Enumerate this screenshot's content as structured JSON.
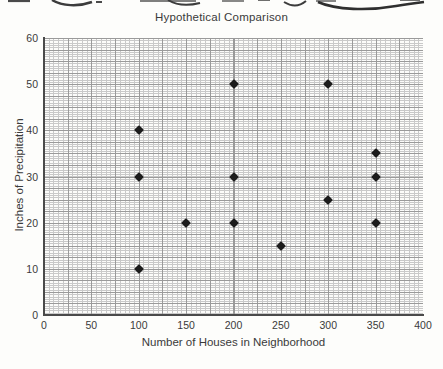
{
  "chart_data": {
    "type": "scatter",
    "title": "Hypothetical Comparison",
    "xlabel": "Number of Houses in Neighborhood",
    "ylabel": "Inches of Precipitation",
    "xlim": [
      0,
      400
    ],
    "ylim": [
      0,
      60
    ],
    "xticks": [
      0,
      50,
      100,
      150,
      200,
      250,
      300,
      350,
      400
    ],
    "yticks": [
      0,
      10,
      20,
      30,
      40,
      50,
      60
    ],
    "grid": true,
    "legend": "none",
    "marker": "diamond",
    "marker_color": "#1c1c1c",
    "points": [
      {
        "x": 100,
        "y": 40
      },
      {
        "x": 100,
        "y": 30
      },
      {
        "x": 100,
        "y": 10
      },
      {
        "x": 150,
        "y": 20
      },
      {
        "x": 200,
        "y": 50
      },
      {
        "x": 200,
        "y": 30
      },
      {
        "x": 200,
        "y": 20
      },
      {
        "x": 250,
        "y": 15
      },
      {
        "x": 300,
        "y": 50
      },
      {
        "x": 300,
        "y": 25
      },
      {
        "x": 350,
        "y": 35
      },
      {
        "x": 350,
        "y": 30
      },
      {
        "x": 350,
        "y": 20
      }
    ]
  },
  "colors": {
    "grid_minor": "#c9c9c9",
    "grid_major": "#9a9a9a",
    "axis": "#4a4a4a",
    "text": "#3a3a3a",
    "background": "#fdfdfb"
  }
}
